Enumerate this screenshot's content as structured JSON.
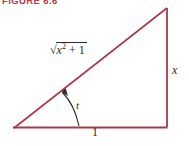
{
  "figure": {
    "caption": "FIGURE 6.6",
    "caption_color": "#b33a46",
    "background_color": "#ffffff",
    "stroke_color": "#a63a46",
    "label_color": "#2b2b2b",
    "width": 189,
    "height": 146
  },
  "diagram": {
    "type": "right-triangle",
    "vertices": {
      "left": {
        "x": 14,
        "y": 128
      },
      "bottom_right": {
        "x": 167,
        "y": 127
      },
      "top_right": {
        "x": 167,
        "y": 8
      }
    },
    "labels": {
      "hypotenuse_prefix": "√",
      "hypotenuse_variable": "x",
      "hypotenuse_exponent": "2",
      "hypotenuse_operator": "+",
      "hypotenuse_constant": "1",
      "angle": "t",
      "base": "1",
      "height": "x"
    },
    "angle_arrow": {
      "name": "angle-indicator-arrow",
      "from": {
        "x": 79,
        "y": 126
      },
      "to": {
        "x": 61,
        "y": 91
      }
    }
  }
}
